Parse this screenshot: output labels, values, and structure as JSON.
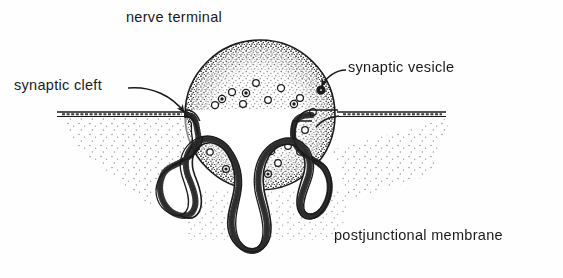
{
  "figure": {
    "background_color": "#fefefe",
    "ink_color": "#1a1a1a",
    "width": 563,
    "height": 278
  },
  "labels": {
    "nerve_terminal": "nerve terminal",
    "synaptic_cleft": "synaptic cleft",
    "synaptic_vesicle": "synaptic vesicle",
    "postjunctional_membrane": "postjunctional membrane"
  },
  "structures": {
    "terminal_bouton": {
      "name": "nerve terminal bouton",
      "center_x": 260,
      "center_y": 115,
      "radius": 75
    },
    "vesicles": {
      "name": "synaptic vesicles",
      "count": 34,
      "radius": 3.4
    },
    "postjunctional_folds": {
      "name": "junctional folds",
      "count": 6
    },
    "synaptic_cleft": {
      "name": "synaptic cleft gap"
    }
  }
}
